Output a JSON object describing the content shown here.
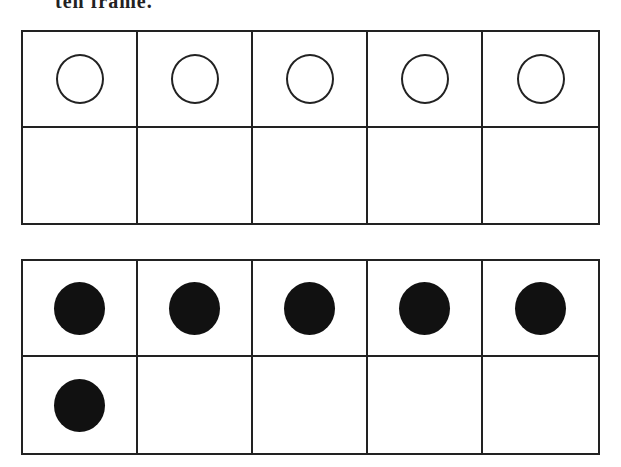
{
  "header": {
    "cut_text": "ten frame."
  },
  "frames": [
    {
      "cells": [
        "open",
        "open",
        "open",
        "open",
        "open",
        "empty",
        "empty",
        "empty",
        "empty",
        "empty"
      ]
    },
    {
      "cells": [
        "filled",
        "filled",
        "filled",
        "filled",
        "filled",
        "filled",
        "empty",
        "empty",
        "empty",
        "empty"
      ]
    }
  ]
}
